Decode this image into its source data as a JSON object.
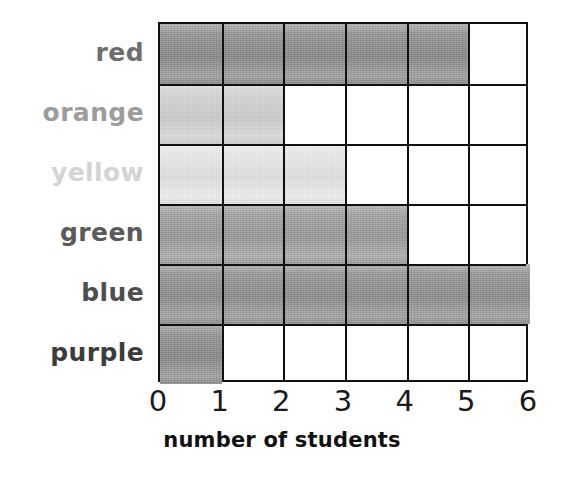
{
  "chart_data": {
    "type": "bar",
    "orientation": "horizontal",
    "title": "",
    "subtitle": "",
    "xlabel": "number of students",
    "ylabel": "",
    "categories": [
      "red",
      "orange",
      "yellow",
      "green",
      "blue",
      "purple"
    ],
    "values": [
      5,
      2,
      3,
      4,
      6,
      1
    ],
    "x_tick_labels": [
      "0",
      "1",
      "2",
      "3",
      "4",
      "5",
      "6"
    ],
    "xlim": [
      0,
      6
    ],
    "grid": true,
    "legend": false,
    "legend_position": "none",
    "bar_colors": [
      "#8a8a8a",
      "#d2d2d2",
      "#e8e8e8",
      "#9a9a9a",
      "#8e8e8e",
      "#8a8a8a"
    ],
    "label_colors": [
      "#6e6e6e",
      "#9c9c9c",
      "#d4d4d4",
      "#5a5a5a",
      "#4e4e4e",
      "#3c3c3c"
    ],
    "bars": [
      {
        "category": "red",
        "value": 5,
        "fill": "#8a8a8a",
        "label_color": "#6e6e6e"
      },
      {
        "category": "orange",
        "value": 2,
        "fill": "#d2d2d2",
        "label_color": "#9c9c9c"
      },
      {
        "category": "yellow",
        "value": 3,
        "fill": "#e8e8e8",
        "label_color": "#d4d4d4"
      },
      {
        "category": "green",
        "value": 4,
        "fill": "#9a9a9a",
        "label_color": "#5a5a5a"
      },
      {
        "category": "blue",
        "value": 6,
        "fill": "#8e8e8e",
        "label_color": "#4e4e4e"
      },
      {
        "category": "purple",
        "value": 1,
        "fill": "#8a8a8a",
        "label_color": "#3c3c3c"
      }
    ]
  },
  "axis": {
    "x_title": "number of students",
    "ticks": [
      "0",
      "1",
      "2",
      "3",
      "4",
      "5",
      "6"
    ]
  },
  "style": {
    "grid_line_color": "#111111",
    "background": "#ffffff"
  }
}
